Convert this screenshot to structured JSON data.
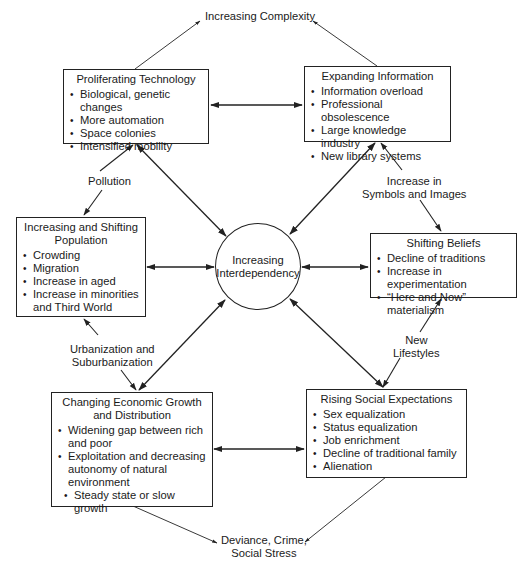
{
  "diagram": {
    "top_label": "Increasing Complexity",
    "bottom_label": "Deviance, Crime, Social Stress",
    "bottom_label_lines": [
      "Deviance, Crime,",
      "Social Stress"
    ],
    "center": {
      "lines": [
        "Increasing",
        "Interdependency"
      ]
    },
    "boxes": {
      "technology": {
        "title": "Proliferating Technology",
        "items": [
          "Biological, genetic changes",
          "More automation",
          "Space colonies",
          "Intensified mobility"
        ]
      },
      "information": {
        "title": "Expanding Information",
        "items": [
          "Information overload",
          "Professional obsolescence",
          "Large knowledge industry",
          "New library systems"
        ]
      },
      "population": {
        "title_lines": [
          "Increasing and Shifting",
          "Population"
        ],
        "items": [
          "Crowding",
          "Migration",
          "Increase in aged",
          "Increase in minorities and Third World"
        ]
      },
      "beliefs": {
        "title": "Shifting Beliefs",
        "items": [
          "Decline of traditions",
          "Increase in experimentation",
          "“Here and Now” materialism"
        ]
      },
      "economic": {
        "title_lines": [
          "Changing Economic Growth",
          "and Distribution"
        ],
        "items": [
          "Widening gap between rich and poor",
          "Exploitation and decreasing autonomy of natural environment",
          "Steady state or slow growth"
        ]
      },
      "social": {
        "title": "Rising Social Expectations",
        "items": [
          "Sex equalization",
          "Status equalization",
          "Job enrichment",
          "Decline of traditional family",
          "Alienation"
        ]
      }
    },
    "edge_labels": {
      "pollution": "Pollution",
      "symbols": [
        "Increase in",
        "Symbols and Images"
      ],
      "urbanization": [
        "Urbanization and",
        "Suburbanization"
      ],
      "lifestyles": [
        "New",
        "Lifestyles"
      ]
    },
    "colors": {
      "line": "#222222",
      "text": "#1a1a1a",
      "background": "#ffffff"
    }
  }
}
